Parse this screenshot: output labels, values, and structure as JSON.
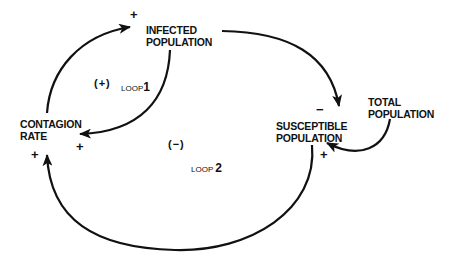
{
  "nodes": {
    "infected": {
      "line1": "INFECTED",
      "line2": "POPULATION"
    },
    "contagion": {
      "line1": "CONTAGION",
      "line2": "RATE"
    },
    "susceptible": {
      "line1": "SUSCEPTIBLE",
      "line2": "POPULATION"
    },
    "total": {
      "line1": "TOTAL",
      "line2": "POPULATION"
    }
  },
  "edges": [
    {
      "from": "CONTAGION RATE",
      "to": "INFECTED POPULATION",
      "polarity": "+"
    },
    {
      "from": "INFECTED POPULATION",
      "to": "CONTAGION RATE",
      "polarity": "+"
    },
    {
      "from": "INFECTED POPULATION",
      "to": "SUSCEPTIBLE POPULATION",
      "polarity": "−"
    },
    {
      "from": "TOTAL POPULATION",
      "to": "SUSCEPTIBLE POPULATION",
      "polarity": "+"
    },
    {
      "from": "SUSCEPTIBLE POPULATION",
      "to": "CONTAGION RATE",
      "polarity": "+"
    }
  ],
  "signs": {
    "infected_in": "+",
    "contagion_in_loop1": "+",
    "contagion_in_loop2": "+",
    "susceptible_in_infected": "−",
    "susceptible_in_total": "+"
  },
  "loops": {
    "loop1": {
      "sign": "(+)",
      "label": "LOOP",
      "number": "1"
    },
    "loop2": {
      "sign": "(−)",
      "label": "LOOP",
      "number": "2"
    }
  },
  "colors": {
    "ink": "#111111",
    "background": "#ffffff"
  }
}
